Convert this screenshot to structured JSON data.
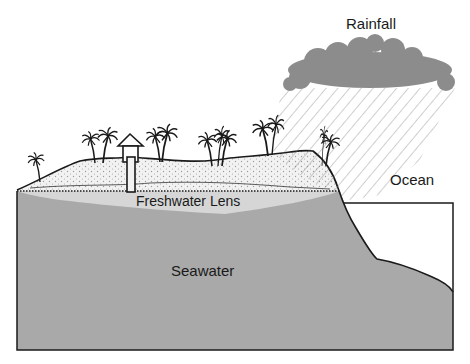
{
  "labels": {
    "rainfall": "Rainfall",
    "ocean": "Ocean",
    "freshwater_lens": "Freshwater Lens",
    "seawater": "Seawater"
  },
  "colors": {
    "seawater": "#a9a9a9",
    "freshwater_lens": "#d6d6d6",
    "island_sand": "#f2f2f2",
    "cloud": "#8c8c8c",
    "outline": "#1a1a1a",
    "background": "#ffffff"
  },
  "elements": {
    "palm_trees_count": 14,
    "well_house": "hut with well shaft"
  }
}
